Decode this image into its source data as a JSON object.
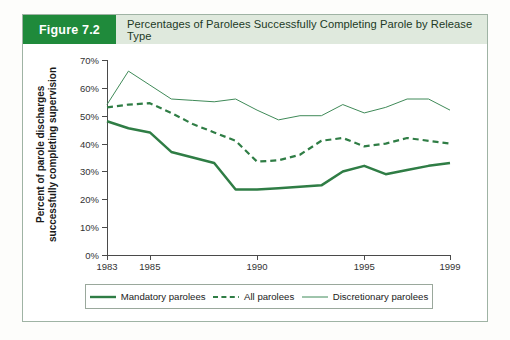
{
  "figure": {
    "badge_label": "Figure 7.2",
    "title": "Percentages of Parolees Successfully Completing Parole by Release Type",
    "badge_color": "#1f8a3b",
    "header_color": "#dfe9dd",
    "frame_border_color": "#9fb3a4"
  },
  "chart_data": {
    "type": "line",
    "title": "Percentages of Parolees Successfully Completing Parole by Release Type",
    "xlabel": "",
    "ylabel": "Percent of parole discharges successfully completing supervision",
    "x": [
      1983,
      1984,
      1985,
      1986,
      1987,
      1988,
      1989,
      1990,
      1991,
      1992,
      1993,
      1994,
      1995,
      1996,
      1997,
      1998,
      1999
    ],
    "xlim": [
      1983,
      1999
    ],
    "ylim": [
      0,
      70
    ],
    "y_tick_values": [
      0,
      10,
      20,
      30,
      40,
      50,
      60,
      70
    ],
    "y_tick_labels": [
      "0%",
      "10%",
      "20%",
      "30%",
      "40%",
      "50%",
      "60%",
      "70%"
    ],
    "x_tick_values": [
      1983,
      1985,
      1990,
      1995,
      1999
    ],
    "x_tick_labels": [
      "1983",
      "1985",
      "1990",
      "1995",
      "1999"
    ],
    "grid": false,
    "legend_position": "bottom",
    "series": [
      {
        "name": "Mandatory parolees",
        "style": "solid-thick",
        "color": "#2f7d45",
        "values": [
          48,
          45.5,
          44,
          37,
          35,
          33,
          23.5,
          23.5,
          24,
          24.5,
          25,
          30,
          32,
          29,
          30.5,
          32,
          33
        ]
      },
      {
        "name": "All parolees",
        "style": "dashed",
        "color": "#2f7d45",
        "values": [
          53,
          54,
          54.5,
          51,
          47,
          44,
          41,
          33.5,
          34,
          36,
          41,
          42,
          39,
          40,
          42,
          41,
          40
        ]
      },
      {
        "name": "Discretionary parolees",
        "style": "solid-thin",
        "color": "#3f8a58",
        "values": [
          54,
          66,
          61,
          56,
          55.5,
          55,
          56,
          52,
          48.5,
          50,
          50,
          54,
          51,
          53,
          56,
          56,
          52
        ]
      }
    ]
  },
  "legend": {
    "items": [
      {
        "label": "Mandatory parolees",
        "style": "solid-thick"
      },
      {
        "label": "All parolees",
        "style": "dashed"
      },
      {
        "label": "Discretionary parolees",
        "style": "solid-thin"
      }
    ]
  }
}
